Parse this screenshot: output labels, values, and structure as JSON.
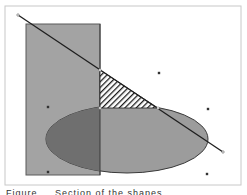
{
  "figure": {
    "caption": "Figure ... Section of the shapes",
    "colors": {
      "background": "#ffffff",
      "frame": "#c8c8c8",
      "rectangle_fill": "#a3a3a3",
      "rectangle_stroke": "#5a5a5a",
      "ellipse_fill": "#9c9c9c",
      "overlap_fill": "#6f6f6f",
      "shape_stroke": "#3a3a3a",
      "line": "#1e1e1e",
      "hatch": "#1e1e1e",
      "dot": "#333333"
    },
    "frame": {
      "x": 5,
      "y": 6,
      "width": 236,
      "height": 179
    },
    "rectangle": {
      "x": 26,
      "y": 24,
      "width": 74,
      "height": 151
    },
    "ellipse": {
      "cx": 127,
      "cy": 139,
      "rx": 81,
      "ry": 34
    },
    "line": {
      "x1": 18,
      "y1": 15,
      "x2": 223,
      "y2": 152
    },
    "hatched_triangle": {
      "points": "100,70 100,108 158,108"
    },
    "vertices": [
      {
        "x": 100,
        "y": 70
      },
      {
        "x": 100,
        "y": 108
      },
      {
        "x": 158,
        "y": 108
      }
    ],
    "dots": [
      {
        "x": 159,
        "y": 73
      },
      {
        "x": 208,
        "y": 109
      },
      {
        "x": 207,
        "y": 174
      },
      {
        "x": 48,
        "y": 107
      },
      {
        "x": 48,
        "y": 172
      }
    ]
  }
}
